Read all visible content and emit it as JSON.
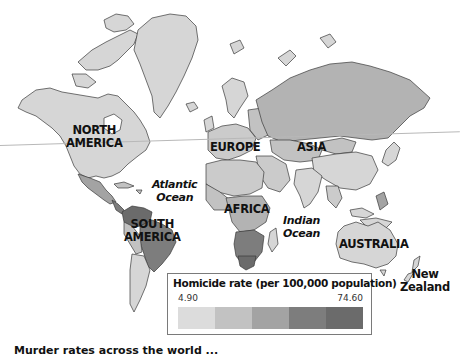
{
  "map": {
    "title": "World homicide rate choropleth",
    "continent_labels": [
      {
        "id": "north-america",
        "text": "NORTH\nAMERICA"
      },
      {
        "id": "south-america",
        "text": "SOUTH\nAMERICA"
      },
      {
        "id": "europe",
        "text": "EUROPE"
      },
      {
        "id": "asia",
        "text": "ASIA"
      },
      {
        "id": "africa",
        "text": "AFRICA"
      },
      {
        "id": "australia",
        "text": "AUSTRALIA"
      },
      {
        "id": "new-zealand",
        "text": "New\nZealand"
      }
    ],
    "ocean_labels": [
      {
        "id": "atlantic",
        "text": "Atlantic\nOcean"
      },
      {
        "id": "indian",
        "text": "Indian\nOcean"
      }
    ],
    "labels": {
      "north_america_1": "NORTH",
      "north_america_2": "AMERICA",
      "south_america_1": "SOUTH",
      "south_america_2": "AMERICA",
      "europe": "EUROPE",
      "asia": "ASIA",
      "africa": "AFRICA",
      "australia": "AUSTRALIA",
      "new_zealand_1": "New",
      "new_zealand_2": "Zealand",
      "atlantic_1": "Atlantic",
      "atlantic_2": "Ocean",
      "indian_1": "Indian",
      "indian_2": "Ocean"
    }
  },
  "legend": {
    "title": "Homicide rate (per 100,000 population)",
    "min_label": "4.90",
    "max_label": "74.60",
    "bins": 5,
    "colors": [
      "#dcdcdc",
      "#c2c2c2",
      "#a3a3a3",
      "#7d7d7d",
      "#6b6b6b"
    ]
  },
  "colors": {
    "land_base": "#d6d6d6",
    "russia": "#b3b3b3",
    "border": "#3a3a3a",
    "background": "#ffffff"
  },
  "caption": {
    "text_partial": "Murder rates across the world ..."
  }
}
